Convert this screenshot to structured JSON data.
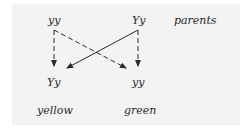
{
  "diagram": {
    "parents": {
      "left": "yy",
      "right": "Yy",
      "row_label": "parents"
    },
    "offspring": {
      "left": "Yy",
      "right": "yy"
    },
    "phenotypes": {
      "left": "yellow",
      "right": "green"
    },
    "edges": [
      {
        "from": "parent-left yy",
        "to": "offspring-left Yy",
        "style": "dashed"
      },
      {
        "from": "parent-left yy",
        "to": "offspring-right yy",
        "style": "dashed"
      },
      {
        "from": "parent-right Yy",
        "to": "offspring-left Yy",
        "style": "solid"
      },
      {
        "from": "parent-right Yy",
        "to": "offspring-right yy",
        "style": "dashed"
      }
    ],
    "colors": {
      "background": "#f3f3f3",
      "ink": "#2a2a2a"
    }
  }
}
